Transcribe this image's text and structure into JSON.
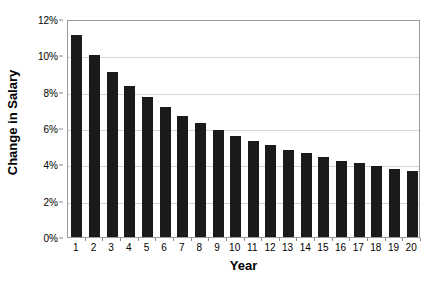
{
  "chart_data": {
    "type": "bar",
    "title": "",
    "xlabel": "Year",
    "ylabel": "Change in Salary",
    "categories": [
      "1",
      "2",
      "3",
      "4",
      "5",
      "6",
      "7",
      "8",
      "9",
      "10",
      "11",
      "12",
      "13",
      "14",
      "15",
      "16",
      "17",
      "18",
      "19",
      "20"
    ],
    "values": [
      11.1,
      10.0,
      9.1,
      8.3,
      7.7,
      7.15,
      6.65,
      6.25,
      5.9,
      5.55,
      5.3,
      5.05,
      4.8,
      4.6,
      4.4,
      4.2,
      4.05,
      3.9,
      3.75,
      3.65
    ],
    "ylim": [
      0,
      12
    ],
    "ytick_values": [
      0,
      2,
      4,
      6,
      8,
      10,
      12
    ],
    "ytick_labels": [
      "0%",
      "2%",
      "4%",
      "6%",
      "8%",
      "10%",
      "12%"
    ],
    "grid": true,
    "grid_axis": "y",
    "legend": false,
    "legend_position": "none",
    "bar_color": "#1a1a1a",
    "gridline_color": "#d4d4d4",
    "axis_color": "#9a9a9a",
    "background_color": "#ffffff"
  }
}
